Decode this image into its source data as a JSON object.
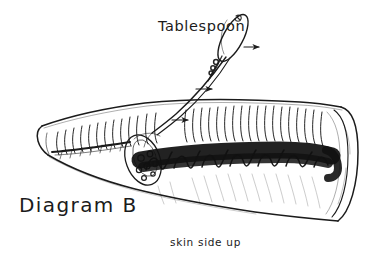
{
  "figure": {
    "title": "Diagram B",
    "background_color": "#ffffff",
    "ink_color": "#1b1b1b",
    "style": "hand-drawn pen and ink line drawing"
  },
  "labels": {
    "tablespoon": "Tablespoon",
    "diagram": "Diagram B",
    "skin_side_up": "skin side up"
  },
  "annotations": {
    "arrows": [
      {
        "name": "arrow-upper",
        "direction": "right",
        "x": 235,
        "y": 47
      },
      {
        "name": "arrow-middle",
        "direction": "right",
        "x": 200,
        "y": 89
      },
      {
        "name": "arrow-lower",
        "direction": "right",
        "x": 175,
        "y": 120
      }
    ]
  },
  "elements": {
    "spoon": "tablespoon with elongated oval bowl and long handle angled down-left into the meat",
    "roast_body": "long tapered roast, pointed at left, rounded open cross-section at right",
    "scoring": "vertical hatch marks along the upper cut face",
    "stuffing": "dark dense scribbled band of stuffing running along the length",
    "shading": "faint diagonal strokes on the lower skin surface"
  }
}
